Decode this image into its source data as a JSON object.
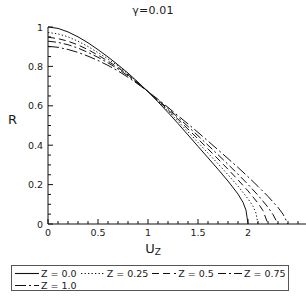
{
  "chart_data": {
    "type": "line",
    "title": "γ=0.01",
    "xlabel": "U",
    "xlabel_sub": "Z",
    "ylabel": "R",
    "ylabel_sub": "",
    "xlim": [
      0,
      2.58
    ],
    "ylim": [
      0,
      1.0
    ],
    "grid": false,
    "legend_position": "below-plot",
    "xticks": [
      {
        "value": 0,
        "label": "0"
      },
      {
        "value": 0.5,
        "label": "0.5"
      },
      {
        "value": 1,
        "label": "1"
      },
      {
        "value": 1.5,
        "label": "1.5"
      },
      {
        "value": 2,
        "label": "2"
      }
    ],
    "xminor_step": 0.1,
    "yticks": [
      {
        "value": 0,
        "label": "0"
      },
      {
        "value": 0.2,
        "label": "0.2"
      },
      {
        "value": 0.4,
        "label": "0.4"
      },
      {
        "value": 0.6,
        "label": "0.6"
      },
      {
        "value": 0.8,
        "label": "0.8"
      },
      {
        "value": 1,
        "label": "1"
      }
    ],
    "yminor_step": 0.05,
    "line_color": "#111111",
    "series": [
      {
        "name": "Z = 0.0",
        "style": "solid",
        "dash": "none",
        "points": [
          [
            0.0,
            1.0
          ],
          [
            0.1,
            0.993
          ],
          [
            0.2,
            0.975
          ],
          [
            0.3,
            0.95
          ],
          [
            0.4,
            0.92
          ],
          [
            0.5,
            0.885
          ],
          [
            0.6,
            0.848
          ],
          [
            0.7,
            0.808
          ],
          [
            0.8,
            0.766
          ],
          [
            0.9,
            0.72
          ],
          [
            1.0,
            0.672
          ],
          [
            1.1,
            0.62
          ],
          [
            1.2,
            0.566
          ],
          [
            1.3,
            0.51
          ],
          [
            1.4,
            0.452
          ],
          [
            1.5,
            0.394
          ],
          [
            1.6,
            0.336
          ],
          [
            1.7,
            0.278
          ],
          [
            1.8,
            0.218
          ],
          [
            1.9,
            0.152
          ],
          [
            1.95,
            0.11
          ],
          [
            1.98,
            0.07
          ],
          [
            2.0,
            0.0
          ]
        ]
      },
      {
        "name": "Z = 0.25",
        "style": "dotted",
        "dash": "1.3,2.2",
        "points": [
          [
            0.0,
            0.972
          ],
          [
            0.1,
            0.965
          ],
          [
            0.2,
            0.95
          ],
          [
            0.3,
            0.928
          ],
          [
            0.4,
            0.901
          ],
          [
            0.5,
            0.87
          ],
          [
            0.6,
            0.838
          ],
          [
            0.7,
            0.802
          ],
          [
            0.8,
            0.762
          ],
          [
            0.9,
            0.718
          ],
          [
            1.0,
            0.672
          ],
          [
            1.1,
            0.624
          ],
          [
            1.2,
            0.574
          ],
          [
            1.3,
            0.522
          ],
          [
            1.4,
            0.468
          ],
          [
            1.5,
            0.414
          ],
          [
            1.6,
            0.36
          ],
          [
            1.7,
            0.306
          ],
          [
            1.8,
            0.25
          ],
          [
            1.9,
            0.192
          ],
          [
            2.0,
            0.128
          ],
          [
            2.05,
            0.09
          ],
          [
            2.08,
            0.055
          ],
          [
            2.1,
            0.0
          ]
        ]
      },
      {
        "name": "Z = 0.5",
        "style": "dashed",
        "dash": "7,4",
        "points": [
          [
            0.0,
            0.948
          ],
          [
            0.1,
            0.941
          ],
          [
            0.2,
            0.928
          ],
          [
            0.3,
            0.909
          ],
          [
            0.4,
            0.885
          ],
          [
            0.5,
            0.857
          ],
          [
            0.6,
            0.827
          ],
          [
            0.7,
            0.794
          ],
          [
            0.8,
            0.757
          ],
          [
            0.9,
            0.716
          ],
          [
            1.0,
            0.672
          ],
          [
            1.1,
            0.627
          ],
          [
            1.2,
            0.58
          ],
          [
            1.3,
            0.532
          ],
          [
            1.4,
            0.482
          ],
          [
            1.5,
            0.432
          ],
          [
            1.6,
            0.381
          ],
          [
            1.7,
            0.33
          ],
          [
            1.8,
            0.278
          ],
          [
            1.9,
            0.224
          ],
          [
            2.0,
            0.168
          ],
          [
            2.1,
            0.106
          ],
          [
            2.15,
            0.068
          ],
          [
            2.2,
            0.0
          ]
        ]
      },
      {
        "name": "Z = 0.75",
        "style": "dashdot",
        "dash": "8,3,2,3",
        "points": [
          [
            0.0,
            0.928
          ],
          [
            0.1,
            0.922
          ],
          [
            0.2,
            0.91
          ],
          [
            0.3,
            0.893
          ],
          [
            0.4,
            0.871
          ],
          [
            0.5,
            0.846
          ],
          [
            0.6,
            0.818
          ],
          [
            0.7,
            0.787
          ],
          [
            0.8,
            0.752
          ],
          [
            0.9,
            0.713
          ],
          [
            1.0,
            0.672
          ],
          [
            1.1,
            0.63
          ],
          [
            1.2,
            0.586
          ],
          [
            1.3,
            0.541
          ],
          [
            1.4,
            0.495
          ],
          [
            1.5,
            0.448
          ],
          [
            1.6,
            0.4
          ],
          [
            1.7,
            0.352
          ],
          [
            1.8,
            0.303
          ],
          [
            1.9,
            0.253
          ],
          [
            2.0,
            0.201
          ],
          [
            2.1,
            0.146
          ],
          [
            2.2,
            0.085
          ],
          [
            2.25,
            0.048
          ],
          [
            2.3,
            0.0
          ]
        ]
      },
      {
        "name": "Z = 1.0",
        "style": "longdashdot",
        "dash": "11,3,2,3",
        "points": [
          [
            0.0,
            0.902
          ],
          [
            0.1,
            0.897
          ],
          [
            0.2,
            0.886
          ],
          [
            0.3,
            0.871
          ],
          [
            0.4,
            0.852
          ],
          [
            0.5,
            0.83
          ],
          [
            0.6,
            0.805
          ],
          [
            0.7,
            0.777
          ],
          [
            0.8,
            0.745
          ],
          [
            0.9,
            0.71
          ],
          [
            1.0,
            0.672
          ],
          [
            1.1,
            0.633
          ],
          [
            1.2,
            0.592
          ],
          [
            1.3,
            0.55
          ],
          [
            1.4,
            0.508
          ],
          [
            1.5,
            0.465
          ],
          [
            1.6,
            0.421
          ],
          [
            1.7,
            0.377
          ],
          [
            1.8,
            0.332
          ],
          [
            1.9,
            0.287
          ],
          [
            2.0,
            0.24
          ],
          [
            2.1,
            0.191
          ],
          [
            2.2,
            0.14
          ],
          [
            2.3,
            0.084
          ],
          [
            2.35,
            0.05
          ],
          [
            2.4,
            0.0
          ]
        ]
      }
    ]
  },
  "legend": {
    "rows": [
      [
        {
          "label": "Z = 0.0",
          "style": "solid"
        },
        {
          "label": "Z = 0.25",
          "style": "dotted"
        },
        {
          "label": "Z = 0.5",
          "style": "dashed"
        },
        {
          "label": "Z = 0.75",
          "style": "dashdot"
        }
      ],
      [
        {
          "label": "Z = 1.0",
          "style": "longdashdot"
        }
      ]
    ]
  }
}
